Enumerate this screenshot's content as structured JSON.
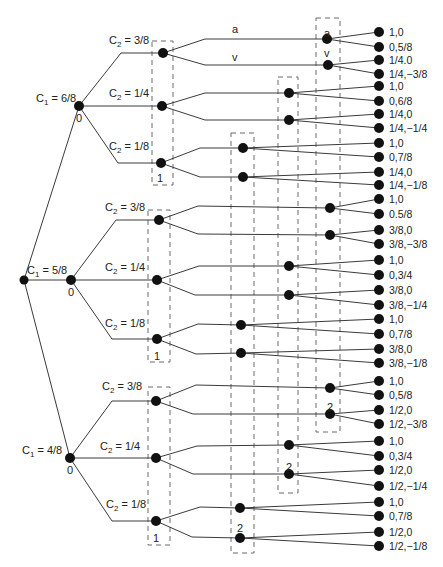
{
  "diagram": {
    "type": "game-tree",
    "colors": {
      "line": "#3a3a3a",
      "node": "#111111",
      "box": "#6a6a6a",
      "text": "#222222"
    },
    "root": {
      "x": 24,
      "y": 280
    },
    "c1_nodes": [
      {
        "label_main": "C",
        "label_sub": "1",
        "label_value": " = 6/8",
        "player": "0",
        "x": 79,
        "y": 106,
        "lx": 36,
        "ly": 102
      },
      {
        "label_main": "C",
        "label_sub": "1",
        "label_value": " = 5/8",
        "player": "0",
        "x": 71,
        "y": 280,
        "lx": 27,
        "ly": 274
      },
      {
        "label_main": "C",
        "label_sub": "1",
        "label_value": " = 4/8",
        "player": "0",
        "x": 70,
        "y": 458,
        "lx": 22,
        "ly": 454
      }
    ],
    "c2_groups": [
      {
        "box": {
          "x": 152,
          "y": 41,
          "w": 21,
          "h": 144
        },
        "player": "1",
        "player_pos": {
          "x": 160,
          "y": 178
        },
        "nodes": [
          {
            "label_main": "C",
            "label_sub": "2",
            "label_value": " = 3/8",
            "x": 163,
            "y": 53,
            "lx": 109,
            "ly": 44,
            "bend": {
              "x": 121,
              "y": 53
            }
          },
          {
            "label_main": "C",
            "label_sub": "2",
            "label_value": " = 1/4",
            "x": 162,
            "y": 106,
            "lx": 109,
            "ly": 97,
            "bend": null
          },
          {
            "label_main": "C",
            "label_sub": "2",
            "label_value": " = 1/8",
            "x": 161,
            "y": 163,
            "lx": 109,
            "ly": 150,
            "bend": {
              "x": 118,
              "y": 163
            }
          }
        ]
      },
      {
        "box": {
          "x": 148,
          "y": 210,
          "w": 22,
          "h": 152
        },
        "player": "1",
        "player_pos": {
          "x": 157,
          "y": 356
        },
        "nodes": [
          {
            "label_main": "C",
            "label_sub": "2",
            "label_value": " = 3/8",
            "x": 159,
            "y": 220,
            "lx": 105,
            "ly": 211,
            "bend": {
              "x": 116,
              "y": 220
            }
          },
          {
            "label_main": "C",
            "label_sub": "2",
            "label_value": " = 1/4",
            "x": 157,
            "y": 280,
            "lx": 105,
            "ly": 271,
            "bend": null
          },
          {
            "label_main": "C",
            "label_sub": "2",
            "label_value": " = 1/8",
            "x": 157,
            "y": 339,
            "lx": 105,
            "ly": 327,
            "bend": {
              "x": 112,
              "y": 339
            }
          }
        ]
      },
      {
        "box": {
          "x": 148,
          "y": 387,
          "w": 22,
          "h": 158
        },
        "player": "1",
        "player_pos": {
          "x": 156,
          "y": 538
        },
        "nodes": [
          {
            "label_main": "C",
            "label_sub": "2",
            "label_value": " = 3/8",
            "x": 156,
            "y": 401,
            "lx": 102,
            "ly": 390,
            "bend": {
              "x": 112,
              "y": 401
            }
          },
          {
            "label_main": "C",
            "label_sub": "2",
            "label_value": " = 1/4",
            "x": 156,
            "y": 458,
            "lx": 100,
            "ly": 450,
            "bend": null
          },
          {
            "label_main": "C",
            "label_sub": "2",
            "label_value": " = 1/8",
            "x": 156,
            "y": 521,
            "lx": 106,
            "ly": 508,
            "bend": {
              "x": 112,
              "y": 521
            }
          }
        ]
      }
    ],
    "p2_infosets": [
      {
        "box": {
          "x": 316,
          "y": 18,
          "w": 24,
          "h": 414
        },
        "player": "2",
        "player_pos": {
          "x": 330,
          "y": 407
        },
        "action_labels_in_box": [
          {
            "text": "a",
            "x": 327,
            "y": 33
          },
          {
            "text": "v",
            "x": 327,
            "y": 53
          }
        ],
        "nodes": [
          {
            "x": 327,
            "y": 39
          },
          {
            "x": 328,
            "y": 65
          },
          {
            "x": 330,
            "y": 208
          },
          {
            "x": 330,
            "y": 235
          },
          {
            "x": 330,
            "y": 388
          },
          {
            "x": 330,
            "y": 414
          }
        ]
      },
      {
        "box": {
          "x": 278,
          "y": 77,
          "w": 20,
          "h": 416
        },
        "player": "2",
        "player_pos": {
          "x": 289,
          "y": 467
        },
        "action_labels_in_box": [],
        "nodes": [
          {
            "x": 289,
            "y": 93
          },
          {
            "x": 289,
            "y": 120
          },
          {
            "x": 289,
            "y": 266
          },
          {
            "x": 289,
            "y": 295
          },
          {
            "x": 289,
            "y": 445
          },
          {
            "x": 289,
            "y": 474
          }
        ]
      },
      {
        "box": {
          "x": 231,
          "y": 133,
          "w": 23,
          "h": 420
        },
        "player": "2",
        "player_pos": {
          "x": 240,
          "y": 528
        },
        "action_labels_in_box": [],
        "nodes": [
          {
            "x": 243,
            "y": 148
          },
          {
            "x": 243,
            "y": 177
          },
          {
            "x": 241,
            "y": 325
          },
          {
            "x": 241,
            "y": 353
          },
          {
            "x": 240,
            "y": 508
          },
          {
            "x": 240,
            "y": 538
          }
        ]
      }
    ],
    "p1_edges_to_p2": [
      {
        "from": [
          163,
          53
        ],
        "bend": [
          205,
          39
        ],
        "to": [
          327,
          39
        ],
        "label": "a",
        "lx": 232,
        "ly": 33
      },
      {
        "from": [
          163,
          53
        ],
        "bend": [
          205,
          65
        ],
        "to": [
          328,
          65
        ],
        "label": "v",
        "lx": 232,
        "ly": 61
      },
      {
        "from": [
          162,
          106
        ],
        "bend": [
          205,
          93
        ],
        "to": [
          289,
          93
        ],
        "label": "",
        "lx": 0,
        "ly": 0
      },
      {
        "from": [
          162,
          106
        ],
        "bend": [
          205,
          120
        ],
        "to": [
          289,
          120
        ],
        "label": "",
        "lx": 0,
        "ly": 0
      },
      {
        "from": [
          161,
          163
        ],
        "bend": [
          200,
          148
        ],
        "to": [
          243,
          148
        ],
        "label": "",
        "lx": 0,
        "ly": 0
      },
      {
        "from": [
          161,
          163
        ],
        "bend": [
          200,
          177
        ],
        "to": [
          243,
          177
        ],
        "label": "",
        "lx": 0,
        "ly": 0
      },
      {
        "from": [
          159,
          220
        ],
        "bend": [
          198,
          206
        ],
        "to": [
          330,
          208
        ],
        "label": "",
        "lx": 0,
        "ly": 0
      },
      {
        "from": [
          159,
          220
        ],
        "bend": [
          198,
          234
        ],
        "to": [
          330,
          235
        ],
        "label": "",
        "lx": 0,
        "ly": 0
      },
      {
        "from": [
          157,
          280
        ],
        "bend": [
          199,
          266
        ],
        "to": [
          289,
          266
        ],
        "label": "",
        "lx": 0,
        "ly": 0
      },
      {
        "from": [
          157,
          280
        ],
        "bend": [
          195,
          295
        ],
        "to": [
          289,
          295
        ],
        "label": "",
        "lx": 0,
        "ly": 0
      },
      {
        "from": [
          157,
          339
        ],
        "bend": [
          198,
          324
        ],
        "to": [
          241,
          325
        ],
        "label": "",
        "lx": 0,
        "ly": 0
      },
      {
        "from": [
          157,
          339
        ],
        "bend": [
          196,
          354
        ],
        "to": [
          241,
          353
        ],
        "label": "",
        "lx": 0,
        "ly": 0
      },
      {
        "from": [
          156,
          401
        ],
        "bend": [
          196,
          385
        ],
        "to": [
          330,
          388
        ],
        "label": "",
        "lx": 0,
        "ly": 0
      },
      {
        "from": [
          156,
          401
        ],
        "bend": [
          193,
          414
        ],
        "to": [
          330,
          414
        ],
        "label": "",
        "lx": 0,
        "ly": 0
      },
      {
        "from": [
          156,
          458
        ],
        "bend": [
          197,
          446
        ],
        "to": [
          289,
          445
        ],
        "label": "",
        "lx": 0,
        "ly": 0
      },
      {
        "from": [
          156,
          458
        ],
        "bend": [
          193,
          474
        ],
        "to": [
          289,
          474
        ],
        "label": "",
        "lx": 0,
        "ly": 0
      },
      {
        "from": [
          156,
          521
        ],
        "bend": [
          200,
          507
        ],
        "to": [
          240,
          508
        ],
        "label": "",
        "lx": 0,
        "ly": 0
      },
      {
        "from": [
          156,
          521
        ],
        "bend": [
          192,
          537
        ],
        "to": [
          240,
          538
        ],
        "label": "",
        "lx": 0,
        "ly": 0
      }
    ],
    "terminals": [
      {
        "y": 32,
        "payoff": "1,0",
        "from_node": [
          327,
          39
        ]
      },
      {
        "y": 47,
        "payoff": "0,5/8",
        "from_node": [
          327,
          39
        ]
      },
      {
        "y": 60,
        "payoff": "1/4.0",
        "from_node": [
          328,
          65
        ]
      },
      {
        "y": 74,
        "payoff": "1/4,−3/8",
        "from_node": [
          328,
          65
        ]
      },
      {
        "y": 86,
        "payoff": "1,0",
        "from_node": [
          289,
          93
        ]
      },
      {
        "y": 101,
        "payoff": "0,6/8",
        "from_node": [
          289,
          93
        ]
      },
      {
        "y": 114,
        "payoff": "1/4,0",
        "from_node": [
          289,
          120
        ]
      },
      {
        "y": 128,
        "payoff": "1/4,−1/4",
        "from_node": [
          289,
          120
        ]
      },
      {
        "y": 143,
        "payoff": "1,0",
        "from_node": [
          243,
          148
        ]
      },
      {
        "y": 157,
        "payoff": "0,7/8",
        "from_node": [
          243,
          148
        ]
      },
      {
        "y": 172,
        "payoff": "1/4,0",
        "from_node": [
          243,
          177
        ]
      },
      {
        "y": 185,
        "payoff": "1/4,−1/8",
        "from_node": [
          243,
          177
        ]
      },
      {
        "y": 199,
        "payoff": "1,0",
        "from_node": [
          330,
          208
        ]
      },
      {
        "y": 214,
        "payoff": "0.5/8",
        "from_node": [
          330,
          208
        ]
      },
      {
        "y": 230,
        "payoff": "3/8,0",
        "from_node": [
          330,
          235
        ]
      },
      {
        "y": 244,
        "payoff": "3/8,−3/8",
        "from_node": [
          330,
          235
        ]
      },
      {
        "y": 260,
        "payoff": "1,0",
        "from_node": [
          289,
          266
        ]
      },
      {
        "y": 275,
        "payoff": "0,3/4",
        "from_node": [
          289,
          266
        ]
      },
      {
        "y": 290,
        "payoff": "3/8,0",
        "from_node": [
          289,
          295
        ]
      },
      {
        "y": 305,
        "payoff": "3/8,−1/4",
        "from_node": [
          289,
          295
        ]
      },
      {
        "y": 319,
        "payoff": "1,0",
        "from_node": [
          241,
          325
        ]
      },
      {
        "y": 334,
        "payoff": "0,7/8",
        "from_node": [
          241,
          325
        ]
      },
      {
        "y": 349,
        "payoff": "3/8,0",
        "from_node": [
          241,
          353
        ]
      },
      {
        "y": 363,
        "payoff": "3/8,−1/8",
        "from_node": [
          241,
          353
        ]
      },
      {
        "y": 381,
        "payoff": "1,0",
        "from_node": [
          330,
          388
        ]
      },
      {
        "y": 395,
        "payoff": "0,5/8",
        "from_node": [
          330,
          388
        ]
      },
      {
        "y": 410,
        "payoff": "1/2,0",
        "from_node": [
          330,
          414
        ]
      },
      {
        "y": 424,
        "payoff": "1/2,−3/8",
        "from_node": [
          330,
          414
        ]
      },
      {
        "y": 441,
        "payoff": "1,0",
        "from_node": [
          289,
          445
        ]
      },
      {
        "y": 456,
        "payoff": "0,3/4",
        "from_node": [
          289,
          445
        ]
      },
      {
        "y": 470,
        "payoff": "1/2,0",
        "from_node": [
          289,
          474
        ]
      },
      {
        "y": 486,
        "payoff": "1/2,−1/4",
        "from_node": [
          289,
          474
        ]
      },
      {
        "y": 502,
        "payoff": "1,0",
        "from_node": [
          240,
          508
        ]
      },
      {
        "y": 516,
        "payoff": "0,7/8",
        "from_node": [
          240,
          508
        ]
      },
      {
        "y": 532,
        "payoff": "1/2,0",
        "from_node": [
          240,
          538
        ]
      },
      {
        "y": 546,
        "payoff": "1/2,−1/8",
        "from_node": [
          240,
          538
        ]
      }
    ],
    "terminal_x": 379,
    "payoff_text_x": 389
  }
}
